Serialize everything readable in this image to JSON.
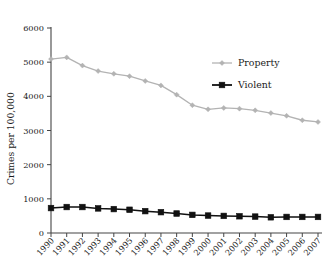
{
  "chart_data": {
    "type": "line",
    "title": "",
    "xlabel": "",
    "ylabel": "Crimes per 100,000",
    "x": [
      "1990",
      "1991",
      "1992",
      "1993",
      "1994",
      "1995",
      "1996",
      "1997",
      "1998",
      "1999",
      "2000",
      "2001",
      "2002",
      "2003",
      "2004",
      "2005",
      "2006",
      "2007"
    ],
    "categories": [
      "1990",
      "1991",
      "1992",
      "1993",
      "1994",
      "1995",
      "1996",
      "1997",
      "1998",
      "1999",
      "2000",
      "2001",
      "2002",
      "2003",
      "2004",
      "2005",
      "2006",
      "2007"
    ],
    "series": [
      {
        "name": "Property",
        "color": "#b3b3b3",
        "marker": "diamond",
        "values": [
          5090,
          5140,
          4900,
          4740,
          4660,
          4590,
          4450,
          4320,
          4050,
          3740,
          3620,
          3660,
          3640,
          3590,
          3510,
          3430,
          3300,
          3250
        ]
      },
      {
        "name": "Violent",
        "color": "#111111",
        "marker": "square",
        "values": [
          730,
          760,
          760,
          720,
          700,
          680,
          640,
          610,
          570,
          530,
          510,
          500,
          490,
          480,
          460,
          470,
          470,
          470
        ]
      }
    ],
    "yticks": [
      0,
      1000,
      2000,
      3000,
      4000,
      5000,
      6000
    ],
    "ytick_labels": [
      "0",
      "1000",
      "2000",
      "3000",
      "4000",
      "5000",
      "6000"
    ],
    "ylim": [
      0,
      6000
    ],
    "grid": false,
    "legend_position": "top-right",
    "legend_entries": [
      "Property",
      "Violent"
    ]
  },
  "axis": {
    "y_title": "Crimes per 100,000"
  },
  "legend": {
    "items": [
      {
        "label": "Property"
      },
      {
        "label": "Violent"
      }
    ]
  }
}
